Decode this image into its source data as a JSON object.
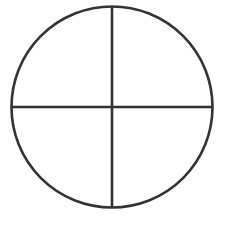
{
  "diagram": {
    "type": "circle-divided-into-quadrants",
    "circle": {
      "cx": 112,
      "cy": 107,
      "r": 100.5
    },
    "dividers": {
      "vertical": {
        "x": 112,
        "y1": 6.5,
        "y2": 207.5
      },
      "horizontal": {
        "y": 107,
        "x1": 11.5,
        "x2": 212.5
      }
    },
    "stroke_color": "#333333",
    "stroke_width": 2.6,
    "background": "#ffffff",
    "quadrant_count": 4
  }
}
